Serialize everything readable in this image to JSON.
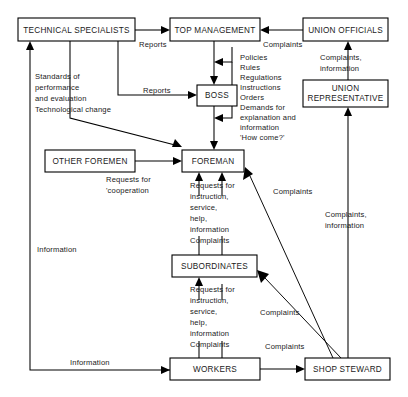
{
  "diagram": {
    "type": "flow-diagram",
    "canvas": {
      "width": 408,
      "height": 397
    },
    "style": {
      "line_color": "#000000",
      "box_fill": "#ffffff",
      "box_stroke": "#000000",
      "text_color": "#1a1a1a"
    },
    "nodes": [
      {
        "id": "technical-specialists",
        "label": "TECHNICAL SPECIALISTS",
        "lines": [
          "TECHNICAL SPECIALISTS"
        ],
        "x": 18,
        "y": 18,
        "w": 117,
        "h": 23
      },
      {
        "id": "top-management",
        "label": "TOP MANAGEMENT",
        "lines": [
          "TOP MANAGEMENT"
        ],
        "x": 170,
        "y": 18,
        "w": 90,
        "h": 23
      },
      {
        "id": "union-officials",
        "label": "UNION OFFICIALS",
        "lines": [
          "UNION OFFICIALS"
        ],
        "x": 303,
        "y": 18,
        "w": 85,
        "h": 23
      },
      {
        "id": "boss",
        "label": "BOSS",
        "lines": [
          "BOSS"
        ],
        "x": 197,
        "y": 85,
        "w": 40,
        "h": 21
      },
      {
        "id": "union-representative",
        "label": "UNION REPRESENTATIVE",
        "lines": [
          "UNION",
          "REPRESENTATIVE"
        ],
        "x": 303,
        "y": 80,
        "w": 85,
        "h": 27
      },
      {
        "id": "other-foremen",
        "label": "OTHER FOREMEN",
        "lines": [
          "OTHER FOREMEN"
        ],
        "x": 45,
        "y": 150,
        "w": 90,
        "h": 22
      },
      {
        "id": "foreman",
        "label": "FOREMAN",
        "lines": [
          "FOREMAN"
        ],
        "x": 182,
        "y": 150,
        "w": 62,
        "h": 22
      },
      {
        "id": "subordinates",
        "label": "SUBORDINATES",
        "lines": [
          "SUBORDINATES"
        ],
        "x": 172,
        "y": 255,
        "w": 85,
        "h": 22
      },
      {
        "id": "workers",
        "label": "WORKERS",
        "lines": [
          "WORKERS"
        ],
        "x": 170,
        "y": 358,
        "w": 90,
        "h": 22
      },
      {
        "id": "shop-steward",
        "label": "SHOP STEWARD",
        "lines": [
          "SHOP STEWARD"
        ],
        "x": 305,
        "y": 358,
        "w": 85,
        "h": 22
      }
    ],
    "edges": [
      {
        "id": "tech-to-topmgmt",
        "from": "technical-specialists",
        "to": "top-management",
        "label": "Reports"
      },
      {
        "id": "tech-to-boss",
        "from": "technical-specialists",
        "to": "boss",
        "label": "Reports"
      },
      {
        "id": "unionofficials-to-topmgmt",
        "from": "union-officials",
        "to": "top-management",
        "label": "Complaints"
      },
      {
        "id": "topmgmt-to-boss",
        "from": "top-management",
        "to": "boss",
        "label": ""
      },
      {
        "id": "boss-to-foreman",
        "from": "boss",
        "to": "foreman",
        "label": ""
      },
      {
        "id": "policies-to-boss",
        "from": "policies-column",
        "to": "boss",
        "label": ""
      },
      {
        "id": "policies-to-foreman",
        "from": "policies-column",
        "to": "foreman",
        "label": ""
      },
      {
        "id": "standards-to-foreman",
        "from": "technical-specialists",
        "to": "foreman",
        "label": "Standards of performance and evaluation Technological change"
      },
      {
        "id": "otherforemen-to-foreman",
        "from": "other-foremen",
        "to": "foreman",
        "label": "Requests for 'cooperation"
      },
      {
        "id": "subordinates-to-foreman",
        "from": "subordinates",
        "to": "foreman",
        "label": "Requests for instruction, service, help, information Complaints"
      },
      {
        "id": "workers-to-subordinates",
        "from": "workers",
        "to": "subordinates",
        "label": "Requests for instruction, service, help, information Complaints"
      },
      {
        "id": "workers-to-tech",
        "from": "workers",
        "to": "technical-specialists",
        "label": "Information"
      },
      {
        "id": "workers-to-shopsteward",
        "from": "workers",
        "to": "shop-steward",
        "label": "Complaints"
      },
      {
        "id": "shopsteward-to-foreman",
        "from": "shop-steward",
        "to": "foreman",
        "label": "Complaints"
      },
      {
        "id": "shopsteward-to-subordinates",
        "from": "shop-steward",
        "to": "subordinates",
        "label": "Complaints"
      },
      {
        "id": "shopsteward-to-unionrep",
        "from": "shop-steward",
        "to": "union-representative",
        "label": "Complaints, information"
      },
      {
        "id": "unionrep-to-unionofficials",
        "from": "union-representative",
        "to": "union-officials",
        "label": "Complaints, information"
      }
    ],
    "labels": [
      {
        "id": "label-reports-top",
        "text": "Reports",
        "x": 139,
        "y": 45,
        "anchor": "start",
        "lines": [
          "Reports"
        ]
      },
      {
        "id": "label-complaints-top",
        "text": "Complaints",
        "x": 263,
        "y": 45,
        "anchor": "start",
        "lines": [
          "Complaints"
        ]
      },
      {
        "id": "label-reports-boss",
        "text": "Reports",
        "x": 143,
        "y": 91,
        "anchor": "start",
        "lines": [
          "Reports"
        ]
      },
      {
        "id": "label-policies-list",
        "text": "Policies Rules Regulations Instructions Orders Demands for explanation and information 'How come?'",
        "x": 240,
        "y": 58,
        "anchor": "start",
        "lines": [
          "Policies",
          "Rules",
          "Regulations",
          "Instructions",
          "Orders",
          "Demands for",
          "   explanation and",
          "   information",
          "'How come?'"
        ]
      },
      {
        "id": "label-standards",
        "text": "Standards of performance and evaluation Technological change",
        "x": 35,
        "y": 77,
        "anchor": "start",
        "lines": [
          "Standards of",
          "performance",
          "and evaluation",
          "Technological change"
        ]
      },
      {
        "id": "label-complaints-info-upper",
        "text": "Complaints, information",
        "x": 320,
        "y": 58,
        "anchor": "start",
        "lines": [
          "Complaints,",
          "information"
        ]
      },
      {
        "id": "label-requests-cooperation",
        "text": "Requests for 'cooperation",
        "x": 106,
        "y": 180,
        "anchor": "start",
        "lines": [
          "Requests for",
          "'cooperation"
        ]
      },
      {
        "id": "label-requests-foreman",
        "text": "Requests for instruction, service, help, information Complaints",
        "x": 190,
        "y": 186,
        "anchor": "start",
        "lines": [
          "Requests for",
          "   instruction,",
          "   service,",
          "   help,",
          "   information",
          "Complaints"
        ]
      },
      {
        "id": "label-requests-subordinates",
        "text": "Requests for instruction, service, help, information Complaints",
        "x": 190,
        "y": 290,
        "anchor": "start",
        "lines": [
          "Requests for",
          "   instruction,",
          "   service,",
          "   help,",
          "   information",
          "Complaints"
        ]
      },
      {
        "id": "label-complaints-foreman-diag",
        "text": "Complaints",
        "x": 273,
        "y": 192,
        "anchor": "start",
        "lines": [
          "Complaints"
        ]
      },
      {
        "id": "label-complaints-info-lower",
        "text": "Complaints, information",
        "x": 325,
        "y": 215,
        "anchor": "start",
        "lines": [
          "Complaints,",
          "information"
        ]
      },
      {
        "id": "label-complaints-subordinates-diag",
        "text": "Complaints",
        "x": 260,
        "y": 313,
        "anchor": "start",
        "lines": [
          "Complaints"
        ]
      },
      {
        "id": "label-information-left",
        "text": "Information",
        "x": 37,
        "y": 250,
        "anchor": "start",
        "lines": [
          "Information"
        ]
      },
      {
        "id": "label-information-bottom",
        "text": "Information",
        "x": 70,
        "y": 363,
        "anchor": "start",
        "lines": [
          "Information"
        ]
      },
      {
        "id": "label-complaints-bottom",
        "text": "Complaints",
        "x": 265,
        "y": 347,
        "anchor": "start",
        "lines": [
          "Complaints"
        ]
      }
    ]
  }
}
